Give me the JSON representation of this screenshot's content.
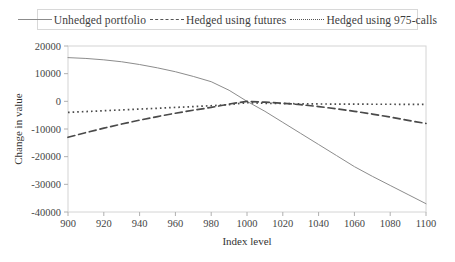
{
  "chart_data": {
    "type": "line",
    "title": "",
    "xlabel": "Index level",
    "ylabel": "Change in value",
    "xlim": [
      900,
      1100
    ],
    "ylim": [
      -40000,
      20000
    ],
    "xticks": [
      900,
      920,
      940,
      960,
      980,
      1000,
      1020,
      1040,
      1060,
      1080,
      1100
    ],
    "xtick_labels": [
      "900",
      "920",
      "940",
      "960",
      "980",
      "1000",
      "1020",
      "1040",
      "1060",
      "1080",
      "1100"
    ],
    "yticks": [
      20000,
      10000,
      0,
      -10000,
      -20000,
      -30000,
      -40000
    ],
    "ytick_labels": [
      "20000",
      "10000",
      "0",
      "-10000",
      "-20000",
      "-30000",
      "-40000"
    ],
    "grid": false,
    "legend_position": "top-center",
    "x": [
      900,
      910,
      920,
      930,
      940,
      950,
      960,
      970,
      980,
      990,
      1000,
      1010,
      1020,
      1030,
      1040,
      1050,
      1060,
      1070,
      1080,
      1090,
      1100
    ],
    "series": [
      {
        "name": "Unhedged portfolio",
        "style": "solid",
        "color": "#8c8c8c",
        "values": [
          15800,
          15500,
          15000,
          14300,
          13300,
          12100,
          10700,
          9000,
          7100,
          4000,
          0,
          -3600,
          -7600,
          -11600,
          -15600,
          -19600,
          -23600,
          -27100,
          -30400,
          -33700,
          -37000
        ]
      },
      {
        "name": "Hedged using futures",
        "style": "dashed",
        "color": "#4a4a4a",
        "values": [
          -13000,
          -11300,
          -9700,
          -8200,
          -6800,
          -5500,
          -4300,
          -3200,
          -2200,
          -1000,
          0,
          -300,
          -700,
          -1200,
          -1900,
          -2700,
          -3600,
          -4600,
          -5700,
          -6900,
          -8000
        ]
      },
      {
        "name": "Hedged using 975-calls",
        "style": "dotted",
        "color": "#4a4a4a",
        "values": [
          -4000,
          -3700,
          -3400,
          -3100,
          -2800,
          -2500,
          -2200,
          -1900,
          -1600,
          -1200,
          -500,
          -700,
          -800,
          -900,
          -950,
          -1000,
          -1000,
          -1050,
          -1050,
          -1100,
          -1100
        ]
      }
    ]
  },
  "plot": {
    "frame_color": "#d4d4d4",
    "tick_color": "#b0b0b0"
  }
}
